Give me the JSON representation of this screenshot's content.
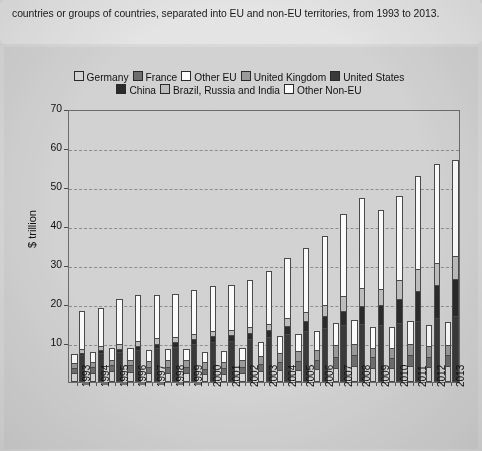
{
  "intro": {
    "text": "countries or groups of countries, separated into EU and non-EU territories, from 1993 to 2013."
  },
  "chart_data": {
    "type": "bar",
    "title": "",
    "subtitle": "",
    "xlabel": "",
    "ylabel": "$ trillion",
    "ylim": [
      0,
      70
    ],
    "yticks": [
      70,
      60,
      50,
      40,
      30,
      20,
      10
    ],
    "grid": true,
    "legend_position": "top-center",
    "stacked": true,
    "grouped": true,
    "group_note": "Each year shows two stacked bars: EU territories (left) and non-EU territories (right)",
    "categories": [
      "1993",
      "1994",
      "1995",
      "1996",
      "1997",
      "1998",
      "1999",
      "2000",
      "2001",
      "2002",
      "2003",
      "2004",
      "2005",
      "2006",
      "2007",
      "2008",
      "2009",
      "2010",
      "2011",
      "2012",
      "2013"
    ],
    "legend_entries": [
      {
        "label": "Germany",
        "color": "#d6d6d6",
        "group": "EU"
      },
      {
        "label": "France",
        "color": "#6e6e6e",
        "group": "EU"
      },
      {
        "label": "Other EU",
        "color": "#fbfbfb",
        "group": "EU"
      },
      {
        "label": "United Kingdom",
        "color": "#9a9a9a",
        "group": "EU"
      },
      {
        "label": "United States",
        "color": "#3a3a3a",
        "group": "non-EU"
      },
      {
        "label": "China",
        "color": "#2b2b2b",
        "group": "non-EU"
      },
      {
        "label": "Brazil, Russia and India",
        "color": "#bdbdbd",
        "group": "non-EU"
      },
      {
        "label": "Other Non-EU",
        "color": "#fbfbfb",
        "group": "non-EU"
      }
    ],
    "series": [
      {
        "name": "Germany",
        "group": "EU",
        "values": [
          2.1,
          2.2,
          2.6,
          2.5,
          2.2,
          2.2,
          2.2,
          1.9,
          1.9,
          2.1,
          2.5,
          2.8,
          2.9,
          3.0,
          3.4,
          3.8,
          3.4,
          3.4,
          3.8,
          3.6,
          3.8
        ]
      },
      {
        "name": "France",
        "group": "EU",
        "values": [
          1.4,
          1.4,
          1.6,
          1.6,
          1.4,
          1.5,
          1.5,
          1.3,
          1.4,
          1.5,
          1.8,
          2.1,
          2.2,
          2.3,
          2.7,
          2.9,
          2.7,
          2.6,
          2.9,
          2.7,
          2.8
        ]
      },
      {
        "name": "United Kingdom",
        "group": "EU",
        "values": [
          1.1,
          1.2,
          1.3,
          1.4,
          1.6,
          1.7,
          1.7,
          1.7,
          1.7,
          1.8,
          2.1,
          2.4,
          2.5,
          2.7,
          3.1,
          2.9,
          2.4,
          2.5,
          2.7,
          2.7,
          2.7
        ]
      },
      {
        "name": "Other EU",
        "group": "EU",
        "values": [
          2.6,
          2.8,
          3.2,
          3.2,
          2.9,
          3.1,
          3.1,
          2.8,
          2.9,
          3.2,
          3.9,
          4.5,
          4.7,
          5.0,
          5.9,
          6.4,
          5.7,
          5.6,
          6.2,
          5.7,
          6.0
        ]
      },
      {
        "name": "United States",
        "group": "non-EU",
        "values": [
          6.9,
          7.3,
          7.6,
          8.1,
          8.6,
          9.1,
          9.7,
          10.3,
          10.6,
          11.0,
          11.5,
          12.3,
          13.1,
          13.9,
          14.5,
          14.7,
          14.4,
          15.0,
          15.5,
          16.2,
          16.8
        ]
      },
      {
        "name": "China",
        "group": "non-EU",
        "values": [
          0.4,
          0.6,
          0.7,
          0.9,
          1.0,
          1.0,
          1.1,
          1.2,
          1.3,
          1.5,
          1.6,
          1.9,
          2.3,
          2.7,
          3.5,
          4.6,
          5.1,
          6.0,
          7.5,
          8.5,
          9.5
        ]
      },
      {
        "name": "Brazil, Russia and India",
        "group": "non-EU",
        "values": [
          0.8,
          0.9,
          1.1,
          1.2,
          1.2,
          1.1,
          1.0,
          1.1,
          1.1,
          1.2,
          1.5,
          1.9,
          2.3,
          2.8,
          3.6,
          4.3,
          4.0,
          4.8,
          5.6,
          5.6,
          5.7
        ]
      },
      {
        "name": "Other Non-EU",
        "group": "non-EU",
        "values": [
          10.0,
          10.3,
          11.9,
          12.0,
          11.6,
          11.4,
          11.8,
          12.0,
          11.9,
          12.4,
          13.9,
          15.8,
          16.7,
          18.0,
          21.6,
          23.6,
          20.6,
          21.9,
          24.1,
          25.5,
          24.8
        ]
      }
    ],
    "eu_totals": [
      7.2,
      7.6,
      8.7,
      8.7,
      8.1,
      8.5,
      8.5,
      7.7,
      7.9,
      8.6,
      10.3,
      11.8,
      12.3,
      13.0,
      15.1,
      16.0,
      14.2,
      14.1,
      15.6,
      14.7,
      15.3
    ],
    "noneu_totals": [
      18.1,
      19.1,
      21.3,
      22.2,
      22.4,
      22.6,
      23.6,
      24.6,
      24.9,
      26.1,
      28.5,
      31.9,
      34.4,
      37.4,
      43.2,
      47.2,
      44.1,
      47.7,
      52.7,
      55.8,
      56.8
    ]
  },
  "axis": {
    "y_title": "$ trillion"
  }
}
